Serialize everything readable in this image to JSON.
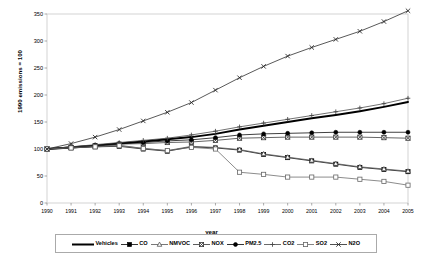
{
  "chart_data": {
    "type": "line",
    "title": "",
    "xlabel": "year",
    "ylabel": "1990 emissions = 100",
    "x": [
      1990,
      1991,
      1992,
      1993,
      1994,
      1995,
      1996,
      1997,
      1998,
      1999,
      2000,
      2001,
      2002,
      2003,
      2004,
      2005
    ],
    "xtick_labels": [
      "1990",
      "1991",
      "1992",
      "1993",
      "1994",
      "1995",
      "1996",
      "1997",
      "1998",
      "1999",
      "2000",
      "2001",
      "2002",
      "2003",
      "2004",
      "2005"
    ],
    "ytick_labels": [
      "0",
      "50",
      "100",
      "150",
      "200",
      "250",
      "300",
      "350"
    ],
    "ytick_values": [
      0,
      50,
      100,
      150,
      200,
      250,
      300,
      350
    ],
    "ylim": [
      0,
      350
    ],
    "xlim": [
      1990,
      2005
    ],
    "grid": false,
    "legend_position": "bottom",
    "series": [
      {
        "name": "Vehicles",
        "marker": "none",
        "line": "thick-solid",
        "color": "#000000",
        "values": [
          100,
          103,
          106,
          110,
          114,
          118,
          122,
          128,
          136,
          143,
          150,
          157,
          163,
          170,
          178,
          187
        ]
      },
      {
        "name": "CO",
        "marker": "filled-square",
        "line": "solid",
        "color": "#000000",
        "values": [
          100,
          102,
          104,
          105,
          100,
          96,
          104,
          102,
          98,
          90,
          84,
          78,
          72,
          66,
          62,
          58
        ]
      },
      {
        "name": "NMVOC",
        "marker": "open-triangle",
        "line": "solid",
        "color": "#555555",
        "values": [
          100,
          103,
          105,
          107,
          101,
          97,
          105,
          103,
          99,
          91,
          85,
          79,
          73,
          67,
          63,
          59
        ]
      },
      {
        "name": "NOX",
        "marker": "crossed-square",
        "line": "solid",
        "color": "#333333",
        "values": [
          100,
          103,
          106,
          109,
          110,
          112,
          113,
          116,
          120,
          121,
          122,
          122,
          122,
          122,
          121,
          120
        ]
      },
      {
        "name": "PM2.5",
        "marker": "filled-circle",
        "line": "solid",
        "color": "#000000",
        "values": [
          100,
          104,
          107,
          110,
          112,
          115,
          117,
          121,
          126,
          128,
          129,
          130,
          131,
          131,
          131,
          131
        ]
      },
      {
        "name": "CO2",
        "marker": "plus",
        "line": "solid",
        "color": "#444444",
        "values": [
          100,
          104,
          108,
          112,
          116,
          120,
          126,
          133,
          141,
          148,
          155,
          162,
          169,
          176,
          184,
          194
        ]
      },
      {
        "name": "SO2",
        "marker": "open-square",
        "line": "solid",
        "color": "#666666",
        "values": [
          100,
          102,
          104,
          106,
          101,
          97,
          103,
          100,
          57,
          53,
          48,
          48,
          48,
          44,
          40,
          33
        ]
      },
      {
        "name": "N2O",
        "marker": "asterisk",
        "line": "solid",
        "color": "#222222",
        "values": [
          100,
          110,
          122,
          136,
          152,
          168,
          186,
          209,
          232,
          253,
          272,
          288,
          303,
          318,
          336,
          356
        ]
      }
    ]
  },
  "legend": {
    "items": [
      {
        "label": "Vehicles"
      },
      {
        "label": "CO"
      },
      {
        "label": "NMVOC"
      },
      {
        "label": "NOX"
      },
      {
        "label": "PM2.5"
      },
      {
        "label": "CO2"
      },
      {
        "label": "SO2"
      },
      {
        "label": "N2O"
      }
    ]
  }
}
